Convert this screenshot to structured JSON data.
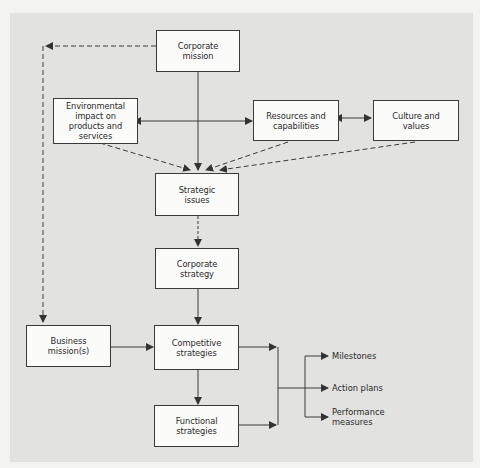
{
  "diagram": {
    "nodes": {
      "corporate_mission": "Corporate\nmission",
      "environmental_impact": "Environmental\nimpact on\nproducts and\nservices",
      "resources_capabilities": "Resources and\ncapabilities",
      "culture_values": "Culture and\nvalues",
      "strategic_issues": "Strategic\nissues",
      "corporate_strategy": "Corporate\nstrategy",
      "business_missions": "Business\nmission(s)",
      "competitive_strategies": "Competitive\nstrategies",
      "functional_strategies": "Functional\nstrategies"
    },
    "outputs": {
      "milestones": "Milestones",
      "action_plans": "Action plans",
      "performance_measures": "Performance\nmeasures"
    },
    "edges": [
      {
        "from": "Corporate mission",
        "to": "Business mission(s)",
        "style": "dashed"
      },
      {
        "from": "Corporate mission",
        "to": "Strategic issues",
        "style": "solid"
      },
      {
        "from": "Environmental impact on products and services",
        "to": "Resources and capabilities",
        "style": "solid-bidirectional"
      },
      {
        "from": "Resources and capabilities",
        "to": "Culture and values",
        "style": "solid-bidirectional"
      },
      {
        "from": "Environmental impact on products and services",
        "to": "Strategic issues",
        "style": "dashed"
      },
      {
        "from": "Resources and capabilities",
        "to": "Strategic issues",
        "style": "dashed"
      },
      {
        "from": "Culture and values",
        "to": "Strategic issues",
        "style": "dashed"
      },
      {
        "from": "Strategic issues",
        "to": "Corporate strategy",
        "style": "dashed"
      },
      {
        "from": "Corporate strategy",
        "to": "Competitive strategies",
        "style": "solid"
      },
      {
        "from": "Business mission(s)",
        "to": "Competitive strategies",
        "style": "solid"
      },
      {
        "from": "Competitive strategies",
        "to": "Functional strategies",
        "style": "solid"
      },
      {
        "from": "Competitive strategies",
        "to": "Outputs",
        "style": "solid"
      },
      {
        "from": "Functional strategies",
        "to": "Outputs",
        "style": "solid"
      }
    ]
  }
}
